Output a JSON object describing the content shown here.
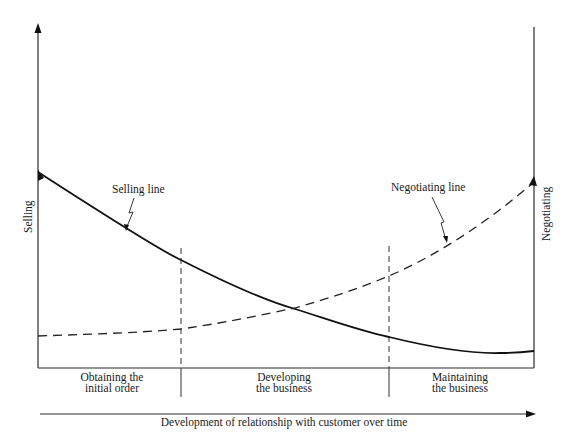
{
  "diagram": {
    "axes": {
      "left_label": "Selling",
      "right_label": "Negotiating",
      "bottom_label": "Development of relationship with customer over time"
    },
    "lines": [
      {
        "name": "Selling line",
        "style": "solid",
        "trend": "decreasing"
      },
      {
        "name": "Negotiating line",
        "style": "dashed",
        "trend": "increasing"
      }
    ],
    "stages": [
      {
        "line1": "Obtaining the",
        "line2": "initial order"
      },
      {
        "line1": "Developing",
        "line2": "the business"
      },
      {
        "line1": "Maintaining",
        "line2": "the business"
      }
    ],
    "colors": {
      "ink": "#1a1a1a",
      "background": "#ffffff"
    }
  }
}
